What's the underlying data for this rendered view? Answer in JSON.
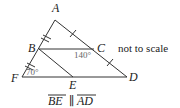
{
  "figure": {
    "points": {
      "A": {
        "label": "A",
        "x": 55,
        "y": 20
      },
      "B": {
        "label": "B",
        "x": 39,
        "y": 49
      },
      "C": {
        "label": "C",
        "x": 94,
        "y": 49
      },
      "D": {
        "label": "D",
        "x": 127,
        "y": 77
      },
      "E": {
        "label": "E",
        "x": 73,
        "y": 77
      },
      "F": {
        "label": "F",
        "x": 22,
        "y": 77
      }
    },
    "segments": [
      "AB",
      "BF",
      "AC",
      "CD",
      "BC",
      "FD",
      "BE"
    ],
    "angles": [
      {
        "vertex": "F",
        "text": "70°"
      },
      {
        "vertex": "C",
        "text": "140°"
      }
    ],
    "note": "not to scale",
    "caption": {
      "left": "BE",
      "symbol": "∥",
      "right": "AD"
    }
  }
}
